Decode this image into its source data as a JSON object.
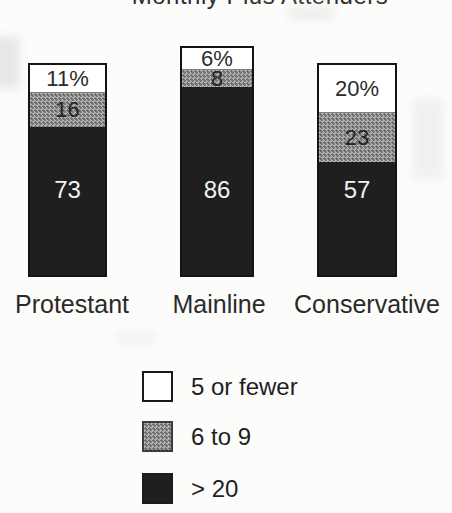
{
  "title": "Monthly Plus Attenders",
  "chart_data": {
    "type": "bar",
    "variant": "stacked-100-percent",
    "title": "Monthly Plus Attenders",
    "categories": [
      "Protestant",
      "Mainline",
      "Conservative"
    ],
    "series": [
      {
        "name": "5 or fewer",
        "color": "#ffffff",
        "values": [
          11,
          6,
          20
        ]
      },
      {
        "name": "6 to 9",
        "color": "#9d9d9d",
        "values": [
          16,
          8,
          23
        ]
      },
      {
        "name": "> 20",
        "color": "#1f1f1f",
        "values": [
          73,
          86,
          57
        ]
      }
    ],
    "bars": [
      {
        "category": "Protestant",
        "labels": {
          "white": "11%",
          "gray": "16",
          "dark": "73"
        }
      },
      {
        "category": "Mainline",
        "labels": {
          "white": "6%",
          "gray": "8",
          "dark": "86"
        }
      },
      {
        "category": "Conservative",
        "labels": {
          "white": "20%",
          "gray": "23",
          "dark": "57"
        }
      }
    ],
    "ylim": [
      0,
      100
    ],
    "grid": false,
    "legend_position": "bottom"
  },
  "legend": {
    "items": [
      {
        "label": "5 or fewer",
        "swatch": "white"
      },
      {
        "label": "6 to 9",
        "swatch": "gray-halftone"
      },
      {
        "label": "> 20",
        "swatch": "black"
      }
    ]
  },
  "colors": {
    "segment_white": "#ffffff",
    "segment_gray": "#9d9d9d",
    "segment_dark": "#1f1f1f",
    "bar_border": "#141414",
    "text_dark": "#2b2b2b",
    "text_light": "#f2f2f2",
    "background": "#fcfcfa"
  }
}
